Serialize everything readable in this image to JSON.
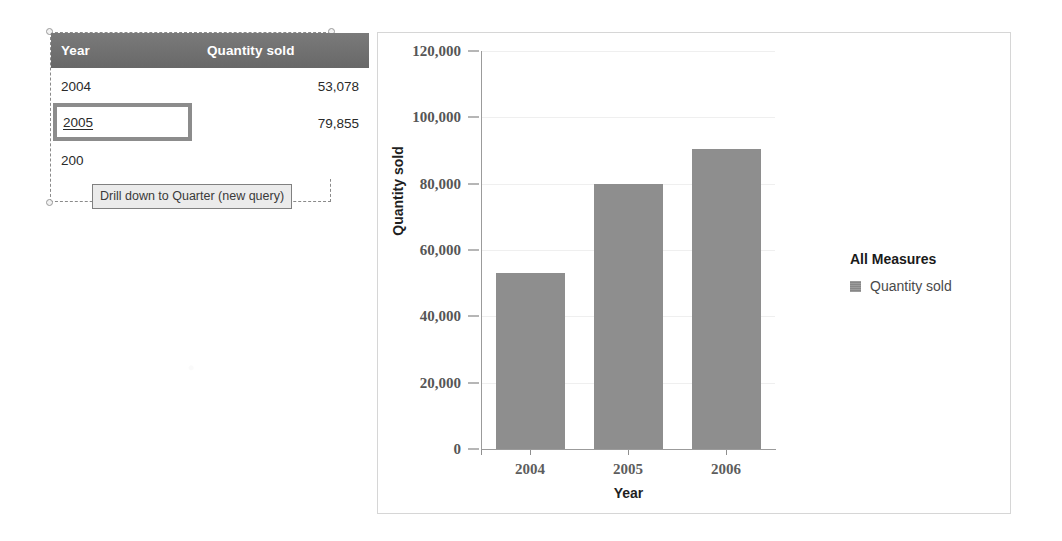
{
  "crosstab": {
    "columns": [
      "Year",
      "Quantity sold"
    ],
    "rows": [
      {
        "year": "2004",
        "quantity": "53,078"
      },
      {
        "year": "2005",
        "quantity": "79,855"
      },
      {
        "year": "2006",
        "quantity": "90,500"
      }
    ],
    "selected_row_label": "2005",
    "truncated_third_year": "200",
    "header_bg": "#6e6e6e",
    "focus_border_color": "#8c8c8c"
  },
  "tooltip": {
    "text": "Drill down to Quarter (new query)",
    "bg": "#ebebeb",
    "border": "#808080"
  },
  "chart": {
    "legend_title": "All Measures",
    "legend_items": [
      {
        "label": "Quantity sold",
        "color": "#8e8e8e"
      }
    ],
    "bar_color": "#8e8e8e"
  },
  "chart_data": {
    "type": "bar",
    "title": "",
    "xlabel": "Year",
    "ylabel": "Quantity sold",
    "categories": [
      "2004",
      "2005",
      "2006"
    ],
    "series": [
      {
        "name": "Quantity sold",
        "values": [
          53078,
          79855,
          90500
        ]
      }
    ],
    "values": [
      53078,
      79855,
      90500
    ],
    "ylim": [
      0,
      120000
    ],
    "yticks": [
      0,
      20000,
      40000,
      60000,
      80000,
      100000,
      120000
    ],
    "ytick_labels": [
      "0",
      "20,000",
      "40,000",
      "60,000",
      "80,000",
      "100,000",
      "120,000"
    ],
    "xtick_labels": [
      "2004",
      "2005",
      "2006"
    ],
    "grid": false,
    "legend_position": "right"
  }
}
